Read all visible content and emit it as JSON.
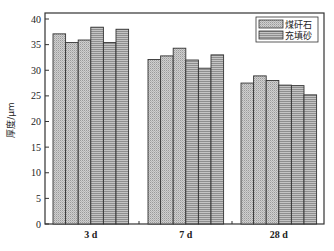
{
  "chart_data": {
    "type": "bar",
    "title": "",
    "xlabel": "",
    "ylabel": "厚度/μm",
    "ylim": [
      0,
      40
    ],
    "yticks": [
      0,
      5,
      10,
      15,
      20,
      25,
      30,
      35,
      40
    ],
    "grid": false,
    "legend_position": "upper right",
    "categories": [
      "3 d",
      "7 d",
      "28 d"
    ],
    "bars_per_group": 6,
    "series": [
      {
        "name": "煤矸石",
        "pattern": "crosshatch",
        "color": "#c8c8c8",
        "values": [
          [
            37.1,
            35.4,
            35.9
          ],
          [
            32.1,
            32.8,
            34.3
          ],
          [
            27.5,
            28.9,
            28.0
          ]
        ]
      },
      {
        "name": "充填砂",
        "pattern": "horizontal-lines",
        "color": "#a8a8a8",
        "values": [
          [
            38.4,
            35.4,
            38.0
          ],
          [
            32.0,
            30.4,
            33.0
          ],
          [
            27.1,
            27.0,
            25.2
          ]
        ]
      }
    ],
    "group_bar_order": [
      [
        37.1,
        35.4,
        35.9,
        38.4,
        35.4,
        38.0
      ],
      [
        32.1,
        32.8,
        34.3,
        32.0,
        30.4,
        33.0
      ],
      [
        27.5,
        28.9,
        28.0,
        27.1,
        27.0,
        25.2
      ]
    ],
    "group_bar_series": [
      "煤矸石",
      "煤矸石",
      "煤矸石",
      "充填砂",
      "充填砂",
      "充填砂"
    ]
  },
  "legend": {
    "items": [
      {
        "label": "煤矸石"
      },
      {
        "label": "充填砂"
      }
    ]
  },
  "axis": {
    "ylabel": "厚度/μm"
  }
}
